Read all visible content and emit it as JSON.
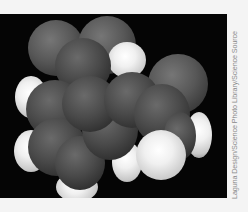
{
  "image": {
    "subject": "space-filling molecular model",
    "background_color": "#050505",
    "atom_colors": {
      "carbon": "#4a4a4a",
      "hydrogen": "#f0f0f0"
    }
  },
  "credit": {
    "text": "Laguna Design/Science Photo Library/Science Source"
  }
}
